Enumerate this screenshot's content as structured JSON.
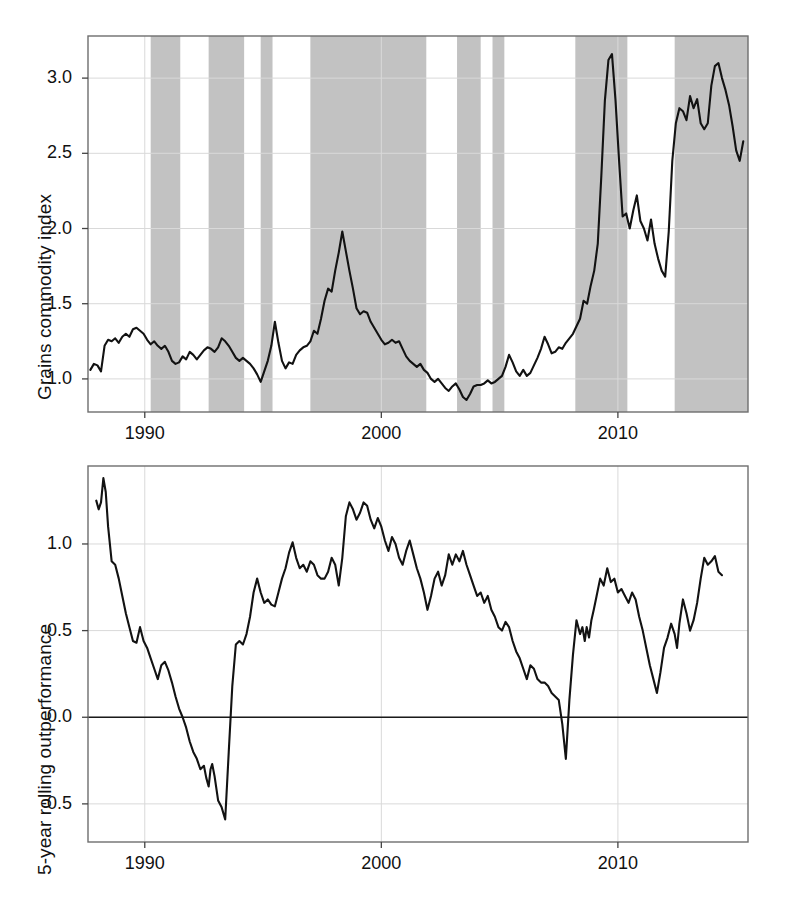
{
  "figure": {
    "width": 789,
    "height": 901,
    "background": "#ffffff",
    "line_color": "#121212",
    "band_color": "#bdbdbd",
    "grid_color": "#d9d9d9",
    "frame_color": "#6e6e6e"
  },
  "chart_data": [
    {
      "id": "grains-commodity-index",
      "type": "line",
      "title": "",
      "xlabel": "",
      "ylabel": "Grains commodity index",
      "xlim": [
        1987.6,
        2015.5
      ],
      "ylim": [
        0.78,
        3.28
      ],
      "xticks": [
        1990,
        2000,
        2010
      ],
      "xtick_labels": [
        "1990",
        "2000",
        "2010"
      ],
      "yticks": [
        1.0,
        1.5,
        2.0,
        2.5,
        3.0
      ],
      "ytick_labels": [
        "1.0",
        "1.5",
        "2.0",
        "2.5",
        "3.0"
      ],
      "grid": true,
      "legend": "none",
      "shaded_bands_label": "shaded periods",
      "shaded_bands": [
        [
          1990.25,
          1991.5
        ],
        [
          1992.7,
          1994.2
        ],
        [
          1994.9,
          1995.4
        ],
        [
          1997.0,
          2001.9
        ],
        [
          2003.2,
          2004.2
        ],
        [
          2004.7,
          2005.2
        ],
        [
          2008.2,
          2010.4
        ],
        [
          2012.4,
          2015.5
        ]
      ],
      "x": [
        1987.7,
        1987.85,
        1988.0,
        1988.15,
        1988.3,
        1988.45,
        1988.6,
        1988.75,
        1988.9,
        1989.05,
        1989.2,
        1989.35,
        1989.5,
        1989.65,
        1989.8,
        1989.95,
        1990.1,
        1990.25,
        1990.4,
        1990.55,
        1990.7,
        1990.85,
        1991.0,
        1991.15,
        1991.3,
        1991.45,
        1991.6,
        1991.75,
        1991.9,
        1992.05,
        1992.2,
        1992.35,
        1992.5,
        1992.65,
        1992.8,
        1992.95,
        1993.1,
        1993.25,
        1993.4,
        1993.55,
        1993.7,
        1993.85,
        1994.0,
        1994.15,
        1994.3,
        1994.45,
        1994.6,
        1994.75,
        1994.9,
        1995.05,
        1995.2,
        1995.35,
        1995.5,
        1995.65,
        1995.8,
        1995.95,
        1996.1,
        1996.25,
        1996.4,
        1996.55,
        1996.7,
        1996.85,
        1997.0,
        1997.15,
        1997.3,
        1997.45,
        1997.6,
        1997.75,
        1997.9,
        1998.05,
        1998.2,
        1998.35,
        1998.5,
        1998.65,
        1998.8,
        1998.95,
        1999.1,
        1999.25,
        1999.4,
        1999.55,
        1999.7,
        1999.85,
        2000.0,
        2000.15,
        2000.3,
        2000.45,
        2000.6,
        2000.75,
        2000.9,
        2001.05,
        2001.2,
        2001.35,
        2001.5,
        2001.65,
        2001.8,
        2001.95,
        2002.1,
        2002.25,
        2002.4,
        2002.55,
        2002.7,
        2002.85,
        2003.0,
        2003.15,
        2003.3,
        2003.45,
        2003.6,
        2003.75,
        2003.9,
        2004.05,
        2004.2,
        2004.35,
        2004.5,
        2004.65,
        2004.8,
        2004.95,
        2005.1,
        2005.25,
        2005.4,
        2005.55,
        2005.7,
        2005.85,
        2006.0,
        2006.15,
        2006.3,
        2006.45,
        2006.6,
        2006.75,
        2006.9,
        2007.05,
        2007.2,
        2007.35,
        2007.5,
        2007.65,
        2007.8,
        2007.95,
        2008.1,
        2008.25,
        2008.4,
        2008.55,
        2008.7,
        2008.85,
        2009.0,
        2009.15,
        2009.3,
        2009.45,
        2009.6,
        2009.75,
        2009.9,
        2010.05,
        2010.2,
        2010.35,
        2010.5,
        2010.65,
        2010.8,
        2010.95,
        2011.1,
        2011.25,
        2011.4,
        2011.55,
        2011.7,
        2011.85,
        2012.0,
        2012.15,
        2012.3,
        2012.45,
        2012.6,
        2012.75,
        2012.9,
        2013.05,
        2013.2,
        2013.35,
        2013.5,
        2013.65,
        2013.8,
        2013.95,
        2014.1,
        2014.25,
        2014.4,
        2014.55,
        2014.7,
        2014.85,
        2015.0,
        2015.15,
        2015.3
      ],
      "y": [
        1.06,
        1.1,
        1.09,
        1.05,
        1.22,
        1.26,
        1.25,
        1.27,
        1.24,
        1.28,
        1.3,
        1.28,
        1.33,
        1.34,
        1.32,
        1.3,
        1.26,
        1.23,
        1.25,
        1.22,
        1.2,
        1.22,
        1.18,
        1.12,
        1.1,
        1.11,
        1.15,
        1.13,
        1.18,
        1.16,
        1.13,
        1.16,
        1.19,
        1.21,
        1.2,
        1.18,
        1.21,
        1.27,
        1.25,
        1.22,
        1.18,
        1.14,
        1.12,
        1.14,
        1.12,
        1.1,
        1.07,
        1.03,
        0.98,
        1.05,
        1.12,
        1.22,
        1.38,
        1.24,
        1.12,
        1.07,
        1.11,
        1.1,
        1.16,
        1.19,
        1.21,
        1.22,
        1.25,
        1.32,
        1.3,
        1.4,
        1.52,
        1.6,
        1.58,
        1.72,
        1.84,
        1.98,
        1.85,
        1.72,
        1.6,
        1.47,
        1.43,
        1.45,
        1.44,
        1.38,
        1.34,
        1.3,
        1.26,
        1.23,
        1.24,
        1.26,
        1.24,
        1.25,
        1.2,
        1.15,
        1.12,
        1.1,
        1.08,
        1.1,
        1.06,
        1.04,
        1.0,
        0.98,
        1.0,
        0.97,
        0.94,
        0.92,
        0.95,
        0.97,
        0.93,
        0.88,
        0.86,
        0.9,
        0.95,
        0.96,
        0.96,
        0.97,
        0.99,
        0.97,
        0.98,
        1.0,
        1.02,
        1.08,
        1.16,
        1.11,
        1.05,
        1.02,
        1.06,
        1.02,
        1.04,
        1.09,
        1.14,
        1.2,
        1.28,
        1.23,
        1.17,
        1.18,
        1.21,
        1.2,
        1.24,
        1.27,
        1.3,
        1.35,
        1.4,
        1.52,
        1.5,
        1.62,
        1.72,
        1.9,
        2.35,
        2.85,
        3.12,
        3.16,
        2.85,
        2.45,
        2.08,
        2.1,
        2.0,
        2.12,
        2.22,
        2.05,
        2.0,
        1.92,
        2.06,
        1.9,
        1.8,
        1.72,
        1.68,
        1.98,
        2.45,
        2.7,
        2.8,
        2.78,
        2.72,
        2.88,
        2.8,
        2.86,
        2.7,
        2.66,
        2.7,
        2.95,
        3.08,
        3.1,
        3.0,
        2.92,
        2.82,
        2.68,
        2.52,
        2.45,
        2.58,
        2.45,
        2.3,
        2.2,
        2.12,
        2.18,
        2.08,
        1.98,
        1.96,
        1.86,
        1.78,
        1.74,
        1.7,
        1.68
      ]
    },
    {
      "id": "5-year-rolling-outperformance",
      "type": "line",
      "title": "",
      "xlabel": "",
      "ylabel": "5-year rolling outperformance",
      "xlim": [
        1987.6,
        2015.5
      ],
      "ylim": [
        -0.72,
        1.45
      ],
      "xticks": [
        1990,
        2000,
        2010
      ],
      "xtick_labels": [
        "1990",
        "2000",
        "2010"
      ],
      "yticks": [
        -0.5,
        0.0,
        0.5,
        1.0
      ],
      "ytick_labels": [
        "-0.5",
        "0.0",
        "0.5",
        "1.0"
      ],
      "grid": true,
      "zero_line": 0.0,
      "legend": "none",
      "x": [
        1987.95,
        1988.05,
        1988.15,
        1988.25,
        1988.35,
        1988.45,
        1988.6,
        1988.75,
        1988.9,
        1989.05,
        1989.2,
        1989.35,
        1989.5,
        1989.65,
        1989.8,
        1989.95,
        1990.1,
        1990.25,
        1990.4,
        1990.55,
        1990.7,
        1990.85,
        1991.0,
        1991.15,
        1991.3,
        1991.45,
        1991.6,
        1991.75,
        1991.9,
        1992.05,
        1992.2,
        1992.35,
        1992.5,
        1992.6,
        1992.7,
        1992.78,
        1992.85,
        1992.95,
        1993.1,
        1993.25,
        1993.4,
        1993.55,
        1993.7,
        1993.85,
        1994.0,
        1994.15,
        1994.3,
        1994.45,
        1994.6,
        1994.75,
        1994.9,
        1995.05,
        1995.2,
        1995.35,
        1995.5,
        1995.65,
        1995.8,
        1995.95,
        1996.1,
        1996.25,
        1996.4,
        1996.55,
        1996.7,
        1996.85,
        1997.0,
        1997.15,
        1997.3,
        1997.45,
        1997.6,
        1997.75,
        1997.9,
        1998.05,
        1998.2,
        1998.35,
        1998.5,
        1998.65,
        1998.8,
        1998.95,
        1999.1,
        1999.25,
        1999.4,
        1999.55,
        1999.7,
        1999.85,
        2000.0,
        2000.15,
        2000.3,
        2000.45,
        2000.6,
        2000.75,
        2000.9,
        2001.05,
        2001.2,
        2001.35,
        2001.5,
        2001.65,
        2001.8,
        2001.95,
        2002.1,
        2002.25,
        2002.4,
        2002.55,
        2002.7,
        2002.85,
        2003.0,
        2003.15,
        2003.3,
        2003.45,
        2003.6,
        2003.75,
        2003.9,
        2004.05,
        2004.2,
        2004.35,
        2004.5,
        2004.65,
        2004.8,
        2004.95,
        2005.1,
        2005.25,
        2005.4,
        2005.55,
        2005.7,
        2005.85,
        2006.0,
        2006.15,
        2006.3,
        2006.45,
        2006.6,
        2006.75,
        2006.9,
        2007.05,
        2007.2,
        2007.35,
        2007.5,
        2007.65,
        2007.8,
        2007.95,
        2008.1,
        2008.25,
        2008.4,
        2008.5,
        2008.6,
        2008.68,
        2008.78,
        2008.88,
        2008.98,
        2009.1,
        2009.25,
        2009.4,
        2009.55,
        2009.7,
        2009.85,
        2010.0,
        2010.15,
        2010.3,
        2010.45,
        2010.6,
        2010.75,
        2010.9,
        2011.05,
        2011.2,
        2011.35,
        2011.5,
        2011.65,
        2011.8,
        2011.95,
        2012.1,
        2012.25,
        2012.4,
        2012.5,
        2012.6,
        2012.75,
        2012.9,
        2013.05,
        2013.2,
        2013.35,
        2013.5,
        2013.65,
        2013.8,
        2013.95,
        2014.1,
        2014.25,
        2014.4,
        2014.55,
        2014.7,
        2014.85,
        2015.0,
        2015.15,
        2015.3
      ],
      "y": [
        1.25,
        1.2,
        1.24,
        1.38,
        1.3,
        1.1,
        0.9,
        0.88,
        0.8,
        0.7,
        0.6,
        0.52,
        0.44,
        0.43,
        0.52,
        0.44,
        0.4,
        0.34,
        0.28,
        0.22,
        0.3,
        0.32,
        0.27,
        0.2,
        0.12,
        0.05,
        0.0,
        -0.06,
        -0.14,
        -0.2,
        -0.24,
        -0.3,
        -0.28,
        -0.35,
        -0.4,
        -0.3,
        -0.27,
        -0.34,
        -0.48,
        -0.52,
        -0.59,
        -0.2,
        0.18,
        0.42,
        0.44,
        0.42,
        0.48,
        0.58,
        0.72,
        0.8,
        0.72,
        0.66,
        0.68,
        0.65,
        0.64,
        0.72,
        0.8,
        0.86,
        0.95,
        1.01,
        0.92,
        0.86,
        0.88,
        0.84,
        0.9,
        0.88,
        0.82,
        0.8,
        0.8,
        0.84,
        0.92,
        0.88,
        0.76,
        0.92,
        1.16,
        1.24,
        1.2,
        1.14,
        1.18,
        1.24,
        1.22,
        1.14,
        1.09,
        1.15,
        1.1,
        1.02,
        0.96,
        1.04,
        1.0,
        0.92,
        0.88,
        0.96,
        1.02,
        0.94,
        0.86,
        0.8,
        0.72,
        0.62,
        0.7,
        0.8,
        0.84,
        0.76,
        0.82,
        0.94,
        0.88,
        0.94,
        0.9,
        0.96,
        0.88,
        0.82,
        0.76,
        0.7,
        0.72,
        0.66,
        0.7,
        0.62,
        0.58,
        0.52,
        0.5,
        0.55,
        0.52,
        0.44,
        0.38,
        0.34,
        0.28,
        0.22,
        0.3,
        0.28,
        0.22,
        0.2,
        0.2,
        0.18,
        0.14,
        0.12,
        0.1,
        -0.04,
        -0.24,
        0.1,
        0.36,
        0.56,
        0.48,
        0.52,
        0.44,
        0.52,
        0.46,
        0.56,
        0.62,
        0.7,
        0.8,
        0.76,
        0.86,
        0.78,
        0.8,
        0.72,
        0.74,
        0.7,
        0.66,
        0.72,
        0.68,
        0.58,
        0.5,
        0.4,
        0.3,
        0.22,
        0.14,
        0.26,
        0.4,
        0.46,
        0.54,
        0.48,
        0.4,
        0.54,
        0.68,
        0.6,
        0.5,
        0.56,
        0.66,
        0.8,
        0.92,
        0.88,
        0.9,
        0.93,
        0.84,
        0.82
      ]
    }
  ]
}
